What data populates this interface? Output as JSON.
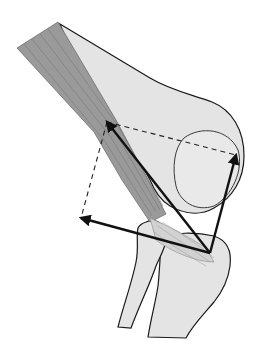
{
  "diagram": {
    "colors": {
      "background": "#ffffff",
      "bone_fill": "#e4e4e4",
      "bone_outline": "#1a1a1a",
      "muscle_fill": "#9a9a9a",
      "muscle_fiber": "#7d7d7d",
      "tendon_fill": "#cfcfcf",
      "vector": "#111111",
      "dashed": "#222222"
    },
    "vectors": {
      "origin": [
        210,
        253
      ],
      "resultant_tip": [
        107,
        122
      ],
      "component_right_tip": [
        236,
        155
      ],
      "component_left_tip": [
        81,
        218
      ]
    },
    "labels": []
  }
}
